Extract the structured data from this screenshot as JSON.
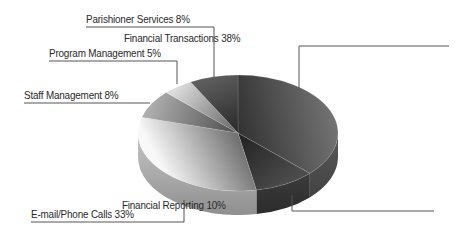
{
  "chart_data": {
    "type": "pie",
    "style": "3d-exploded-none",
    "title": "",
    "categories": [
      "Financial Transactions",
      "Financial Reporting",
      "E-mail/Phone Calls",
      "Staff Management",
      "Program Management",
      "Parishioner Services"
    ],
    "values": [
      38,
      10,
      33,
      8,
      5,
      8
    ],
    "unit": "%",
    "legend": "none",
    "labels": [
      {
        "text": "Financial Transactions 38%",
        "name": "Financial Transactions",
        "value": 38
      },
      {
        "text": "Financial Reporting 10%",
        "name": "Financial Reporting",
        "value": 10
      },
      {
        "text": "E-mail/Phone Calls 33%",
        "name": "E-mail/Phone Calls",
        "value": 33
      },
      {
        "text": "Staff Management 8%",
        "name": "Staff Management",
        "value": 8
      },
      {
        "text": "Program Management 5%",
        "name": "Program Management",
        "value": 5
      },
      {
        "text": "Parishioner Services 8%",
        "name": "Parishioner Services",
        "value": 8
      }
    ],
    "colors": [
      "#5a5a5a",
      "#3c3c3c",
      "#c6c6c6",
      "#8a8a8a",
      "#b0b0b0",
      "#4a4a4a"
    ]
  }
}
